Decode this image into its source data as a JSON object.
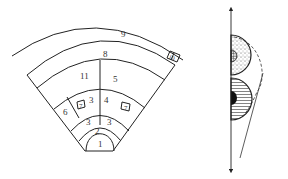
{
  "colors": {
    "line": "#222222",
    "text": "#333333",
    "background": "#ffffff",
    "fill_dark": "#111111"
  },
  "fan_diagram": {
    "labels": {
      "r1": "1",
      "r2": "2",
      "r3_left": "3",
      "r3_right": "3",
      "r3_upper": "3",
      "r4": "4",
      "r5": "5",
      "r6": "6",
      "r7_left": "7",
      "r7_right": "7",
      "r8": "8",
      "r9": "9",
      "r10": "10",
      "r11": "11"
    }
  },
  "profile_diagram": {
    "axis": "vertical double-headed arrow",
    "upper_body": "stippled half-disc with cross-hatched core",
    "lower_body": "horizontally hatched half-disc with solid black core",
    "envelope": "dashed arc",
    "slope": "inclined straight line"
  }
}
